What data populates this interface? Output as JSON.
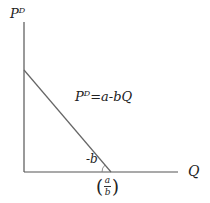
{
  "diagram": {
    "y_axis": {
      "label": "P",
      "label_sup": "D"
    },
    "x_axis": {
      "label": "Q"
    },
    "curve": {
      "label": "P",
      "label_sup": "D",
      "equation": "=a-bQ"
    },
    "slope_label": "-b",
    "x_intercept": {
      "open": "(",
      "numerator": "a",
      "denominator": "b",
      "close": ")"
    },
    "colors": {
      "axis": "#555555",
      "curve": "#666666",
      "text": "#222222"
    }
  }
}
